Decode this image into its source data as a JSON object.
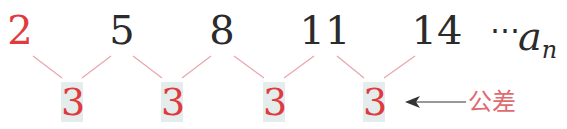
{
  "sequence": {
    "terms": [
      "2",
      "5",
      "8",
      "11",
      "14"
    ],
    "ellipsis": "⋯",
    "general_term_var": "a",
    "general_term_sub": "n"
  },
  "differences": [
    "3",
    "3",
    "3",
    "3"
  ],
  "annotation": {
    "label": "公差",
    "arrow": "left-arrow"
  },
  "colors": {
    "first_term": "#e03a3e",
    "terms": "#2b2b2b",
    "difference_text": "#e03a3e",
    "difference_box": "#e4ecec",
    "connector": "#e8a8ae",
    "label": "#e06a70",
    "arrow": "#333333"
  }
}
